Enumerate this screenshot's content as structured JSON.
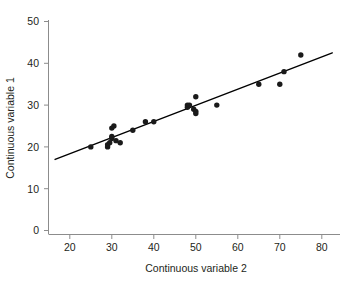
{
  "chart_data": {
    "type": "scatter",
    "title": "",
    "subtitle": "",
    "xlabel": "Continuous variable 2",
    "ylabel": "Continuous variable 1",
    "xlim": [
      16,
      83
    ],
    "ylim": [
      -1.5,
      52
    ],
    "xticks": [
      20,
      30,
      40,
      50,
      60,
      70,
      80
    ],
    "xticklabels": [
      "20",
      "30",
      "40",
      "50",
      "60",
      "70",
      "80"
    ],
    "yticks": [
      0,
      10,
      20,
      30,
      40,
      50
    ],
    "yticklabels": [
      "0",
      "10",
      "20",
      "30",
      "40",
      "50"
    ],
    "grid": false,
    "legend": null,
    "annotations": [],
    "marker": {
      "shape": "circle",
      "color": "#1a1a1a",
      "size_px": 5.4
    },
    "series": [
      {
        "name": "observations",
        "x": [
          25,
          29,
          29,
          29.5,
          30,
          30,
          30,
          30.5,
          31,
          32,
          35,
          38,
          40,
          48,
          48,
          48.5,
          49.5,
          50,
          50,
          50,
          55,
          65,
          70,
          71,
          75
        ],
        "y": [
          20,
          20,
          20.5,
          21,
          22,
          22.5,
          24.5,
          25,
          21.5,
          21,
          24,
          26,
          26,
          30,
          29.5,
          30,
          29,
          32,
          28.5,
          28,
          30,
          35,
          35,
          38,
          42
        ]
      }
    ],
    "fit_line": {
      "type": "linear-regression",
      "color": "#000000",
      "x_start": 16.5,
      "y_start": 17,
      "x_end": 82.5,
      "y_end": 42.5
    }
  },
  "axis": {
    "x_title": "Continuous variable 2",
    "y_title": "Continuous variable 1"
  }
}
